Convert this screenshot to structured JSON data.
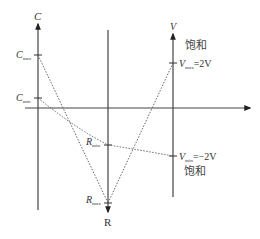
{
  "diagram": {
    "axes": {
      "c_axis": {
        "label": "C",
        "ticks": [
          {
            "main": "C",
            "sub": "max"
          },
          {
            "main": "C",
            "sub": "min"
          }
        ]
      },
      "v_axis": {
        "label": "V",
        "ticks": [
          {
            "main": "V",
            "sub": "max",
            "value": "=2V"
          },
          {
            "main": "V",
            "sub": "min",
            "value": "=−2V"
          }
        ]
      },
      "r_axis": {
        "label": "R",
        "ticks": [
          {
            "main": "R",
            "sub": "min"
          },
          {
            "main": "R",
            "sub": "max"
          }
        ]
      }
    },
    "annotations": {
      "saturation_top": "饱和",
      "saturation_bottom": "饱和"
    },
    "colors": {
      "axis": "#444444",
      "dotted": "#555555",
      "text": "#333333"
    }
  }
}
